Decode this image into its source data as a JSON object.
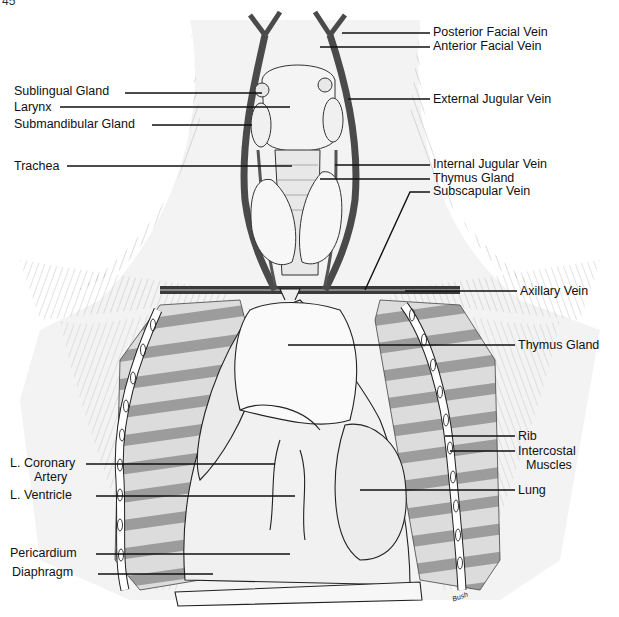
{
  "figure": {
    "figure_number_partial": "45",
    "signature": "Bush"
  },
  "labels_left": [
    {
      "id": "sublingual-gland",
      "text": "Sublingual Gland",
      "x": 14,
      "y": 85
    },
    {
      "id": "larynx",
      "text": "Larynx",
      "x": 14,
      "y": 101
    },
    {
      "id": "submandibular-gland",
      "text": "Submandibular Gland",
      "x": 14,
      "y": 118
    },
    {
      "id": "trachea",
      "text": "Trachea",
      "x": 14,
      "y": 160
    },
    {
      "id": "l-coronary-artery",
      "text": "L. Coronary",
      "text2": "Artery",
      "x": 10,
      "y": 457
    },
    {
      "id": "l-ventricle",
      "text": "L. Ventricle",
      "x": 10,
      "y": 488
    },
    {
      "id": "pericardium",
      "text": "Pericardium",
      "x": 10,
      "y": 547
    },
    {
      "id": "diaphragm",
      "text": "Diaphragm",
      "x": 12,
      "y": 566
    }
  ],
  "labels_right": [
    {
      "id": "posterior-facial-vein",
      "text": "Posterior Facial Vein",
      "x": 433,
      "y": 27
    },
    {
      "id": "anterior-facial-vein",
      "text": "Anterior Facial Vein",
      "x": 433,
      "y": 41
    },
    {
      "id": "external-jugular-vein",
      "text": "External Jugular Vein",
      "x": 433,
      "y": 94
    },
    {
      "id": "internal-jugular-vein",
      "text": "Internal Jugular Vein",
      "x": 433,
      "y": 159
    },
    {
      "id": "thymus-gland-upper",
      "text": "Thymus Gland",
      "x": 433,
      "y": 173
    },
    {
      "id": "subscapular-vein",
      "text": "Subscapular Vein",
      "x": 433,
      "y": 186
    },
    {
      "id": "axillary-vein",
      "text": "Axillary Vein",
      "x": 520,
      "y": 286
    },
    {
      "id": "thymus-gland-lower",
      "text": "Thymus Gland",
      "x": 518,
      "y": 339
    },
    {
      "id": "rib",
      "text": "Rib",
      "x": 518,
      "y": 430
    },
    {
      "id": "intercostal-muscles",
      "text": "Intercostal",
      "text2": "Muscles",
      "x": 518,
      "y": 445
    },
    {
      "id": "lung",
      "text": "Lung",
      "x": 518,
      "y": 484
    }
  ],
  "colors": {
    "ink": "#111111",
    "background": "#ffffff",
    "vein": "#4a4a4a",
    "shade": "#9a9a9a",
    "light_shade": "#d6d6d6"
  }
}
